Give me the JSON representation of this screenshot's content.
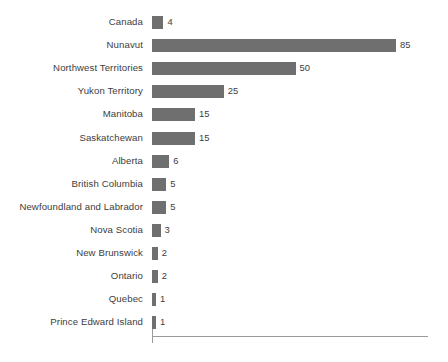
{
  "chart_data": {
    "type": "bar",
    "orientation": "horizontal",
    "title": "",
    "subtitle": "",
    "xlabel": "",
    "ylabel": "",
    "grid": false,
    "legend": null,
    "xlim": [
      0,
      96
    ],
    "axis_line_color": "#9a9a9a",
    "bar_color": "#6f6f6f",
    "text_color": "#3d3d3d",
    "categories": [
      "Canada",
      "Nunavut",
      "Northwest Territories",
      "Yukon Territory",
      "Manitoba",
      "Saskatchewan",
      "Alberta",
      "British Columbia",
      "Newfoundland and Labrador",
      "Nova Scotia",
      "New Brunswick",
      "Ontario",
      "Quebec",
      "Prince Edward Island"
    ],
    "values": [
      4,
      85,
      50,
      25,
      15,
      15,
      6,
      5,
      5,
      3,
      2,
      2,
      1,
      1
    ],
    "data_labels": [
      "4",
      "85",
      "50",
      "25",
      "15",
      "15",
      "6",
      "5",
      "5",
      "3",
      "2",
      "2",
      "1",
      "1"
    ]
  }
}
